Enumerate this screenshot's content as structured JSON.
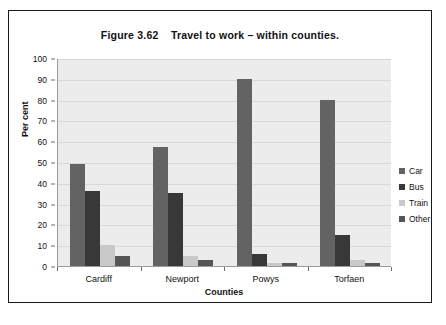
{
  "figure": {
    "title": "Figure 3.62    Travel to work – within counties."
  },
  "chart_data": {
    "type": "bar",
    "title": "Figure 3.62    Travel to work – within counties.",
    "xlabel": "Counties",
    "ylabel": "Per cent",
    "categories": [
      "Cardiff",
      "Newport",
      "Powys",
      "Torfaen"
    ],
    "series": [
      {
        "name": "Car",
        "color": "#636363",
        "values": [
          49,
          57,
          90,
          80
        ]
      },
      {
        "name": "Bus",
        "color": "#383838",
        "values": [
          36,
          35,
          6,
          15
        ]
      },
      {
        "name": "Train",
        "color": "#c9c9c9",
        "values": [
          10,
          5,
          1.5,
          3
        ]
      },
      {
        "name": "Other",
        "color": "#565656",
        "values": [
          5,
          3,
          1.5,
          1.5
        ]
      }
    ],
    "ylim": [
      0,
      100
    ],
    "yticks": [
      0,
      10,
      20,
      30,
      40,
      50,
      60,
      70,
      80,
      90,
      100
    ],
    "ytick_labels": [
      "0",
      "10",
      "20",
      "30",
      "40",
      "50",
      "60",
      "70",
      "80",
      "90",
      "100"
    ],
    "grid": true,
    "legend_position": "right",
    "plot_background": "#ececec",
    "frame_color": "#1a1a1a"
  }
}
